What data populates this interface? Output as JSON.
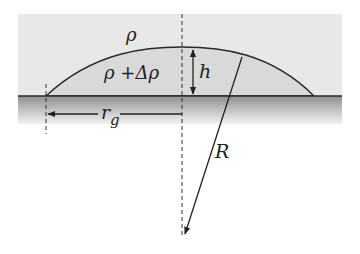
{
  "diagram": {
    "labels": {
      "outer_density": "ρ",
      "inner_density": "ρ +Δρ",
      "height": "h",
      "radius_ground": "r",
      "radius_ground_sub": "g",
      "curvature_radius": "R"
    },
    "colors": {
      "upper_background": "#e6e6e6",
      "dome_fill": "#d8d8d8",
      "ground_top": "#8c8c8c",
      "ground_bottom": "#f0f0f0",
      "line": "#2a2a2a"
    }
  }
}
